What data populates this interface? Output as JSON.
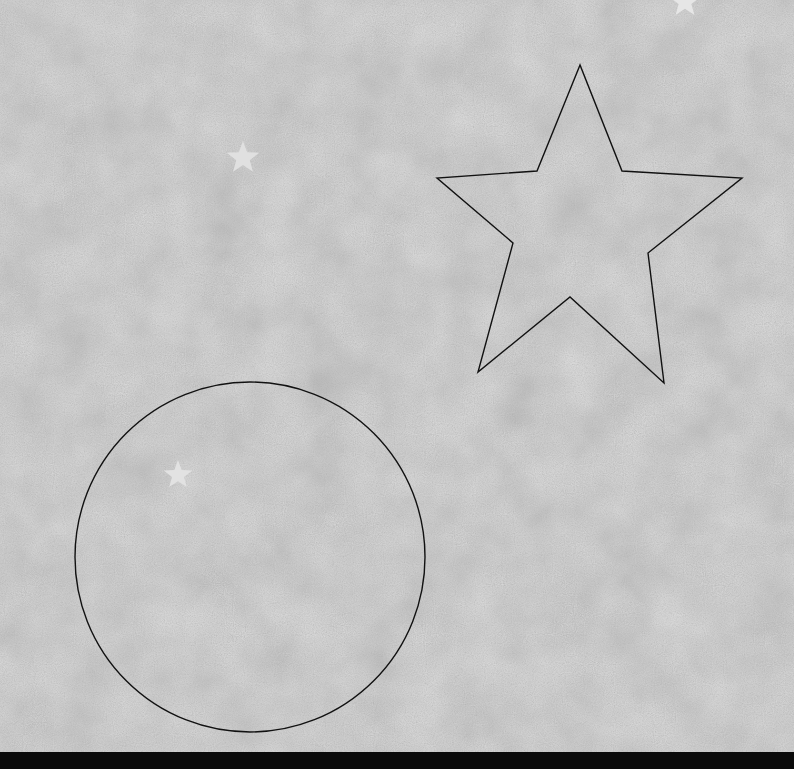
{
  "scene": {
    "background": {
      "color": "#a9a9a9",
      "texture": "paper-noise",
      "light": "#cfcfcf",
      "dark": "#8f8f8f"
    },
    "outline_color": "#111111",
    "star_outline": {
      "points": [
        [
          580,
          65
        ],
        [
          537,
          171
        ],
        [
          437,
          178
        ],
        [
          513,
          243
        ],
        [
          478,
          372
        ],
        [
          570,
          297
        ],
        [
          664,
          383
        ],
        [
          648,
          253
        ],
        [
          742,
          178
        ],
        [
          622,
          171
        ]
      ]
    },
    "circle_outline": {
      "cx": 250,
      "cy": 557,
      "r": 175
    },
    "small_stars": [
      {
        "cx": 685,
        "cy": 2,
        "r": 16,
        "color": "#e6e6e6"
      },
      {
        "cx": 243,
        "cy": 158,
        "r": 17,
        "color": "#e0e0e0"
      },
      {
        "cx": 178,
        "cy": 475,
        "r": 15,
        "color": "#e2e2e2"
      }
    ],
    "bottom_bar": {
      "color": "#0a0a0a",
      "height": 17
    }
  }
}
